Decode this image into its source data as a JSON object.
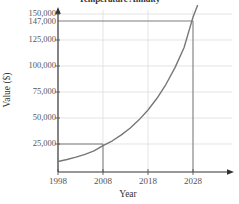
{
  "chart_data": {
    "type": "line",
    "title": "Temperature Annuity",
    "xlabel": "Year",
    "ylabel": "Value ($)",
    "xlim": [
      1998,
      2030
    ],
    "ylim": [
      0,
      155000
    ],
    "grid": true,
    "legend": false,
    "x_ticks": [
      1998,
      2008,
      2018,
      2028
    ],
    "x_tick_labels": [
      "1998",
      "2008",
      "2018",
      "2028"
    ],
    "y_ticks": [
      25000,
      50000,
      75000,
      100000,
      125000,
      147000,
      150000
    ],
    "y_tick_labels": [
      "25,000",
      "50,000",
      "75,000",
      "100,000",
      "125,000",
      "147,000",
      "150,000"
    ],
    "series": [
      {
        "name": "Annuity value",
        "color": "#777777",
        "x": [
          1998,
          2000,
          2002,
          2004,
          2006,
          2008,
          2010,
          2012,
          2014,
          2016,
          2018,
          2020,
          2022,
          2024,
          2026,
          2028,
          2029
        ],
        "values": [
          10000,
          11900,
          14100,
          16800,
          20000,
          25000,
          29400,
          35000,
          41600,
          49500,
          58900,
          70000,
          83300,
          99100,
          117900,
          147000,
          158000
        ]
      }
    ],
    "annotations": [
      {
        "name": "marker-2008",
        "x": 2008,
        "y": 25000,
        "label": "25,000 at 2008",
        "color": "#666666"
      },
      {
        "name": "marker-2028",
        "x": 2028,
        "y": 147000,
        "label": "147,000 at 2028",
        "color": "#666666"
      }
    ]
  },
  "axes": {
    "x_title": "Year",
    "y_title": "Value ($)"
  }
}
